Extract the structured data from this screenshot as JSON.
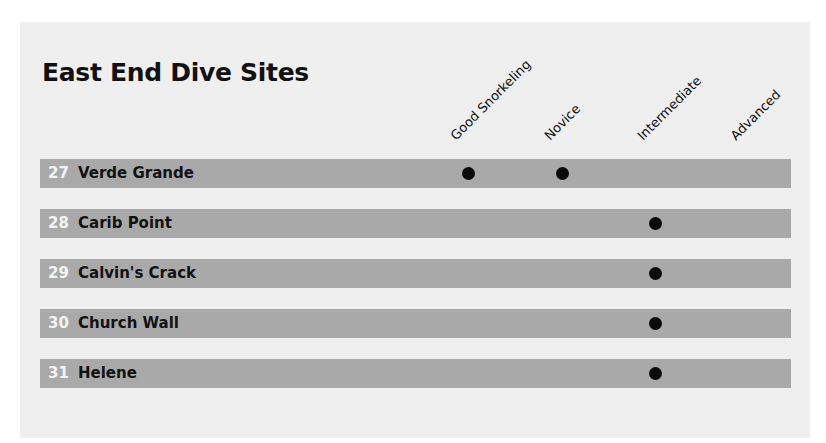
{
  "title": "East End Dive Sites",
  "columns": [
    {
      "label": "Good Snorkeling",
      "x": 468
    },
    {
      "label": "Novice",
      "x": 562
    },
    {
      "label": "Intermediate",
      "x": 655
    },
    {
      "label": "Advanced",
      "x": 748
    }
  ],
  "sites": [
    {
      "number": "27",
      "name": "Verde Grande",
      "marks": [
        true,
        true,
        false,
        false
      ]
    },
    {
      "number": "28",
      "name": "Carib Point",
      "marks": [
        false,
        false,
        true,
        false
      ]
    },
    {
      "number": "29",
      "name": "Calvin's Crack",
      "marks": [
        false,
        false,
        true,
        false
      ]
    },
    {
      "number": "30",
      "name": "Church Wall",
      "marks": [
        false,
        false,
        true,
        false
      ]
    },
    {
      "number": "31",
      "name": "Helene",
      "marks": [
        false,
        false,
        true,
        false
      ]
    }
  ],
  "marker_icon": "filled-circle-icon"
}
